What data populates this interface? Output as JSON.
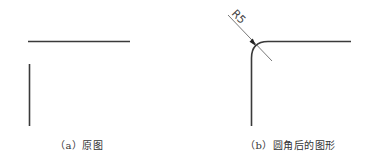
{
  "figures": [
    {
      "id": "a",
      "caption": "（a）原图",
      "description": "two separate perpendicular line segments: one horizontal, one vertical, not joined"
    },
    {
      "id": "b",
      "caption": "（b）圆角后的图形",
      "description": "the two segments joined by a fillet arc",
      "dimension": {
        "label": "R5",
        "type": "radius"
      }
    }
  ],
  "colors": {
    "line": "#3a3a3a",
    "leader": "#555555",
    "caption": "#333333",
    "background": "#ffffff"
  }
}
